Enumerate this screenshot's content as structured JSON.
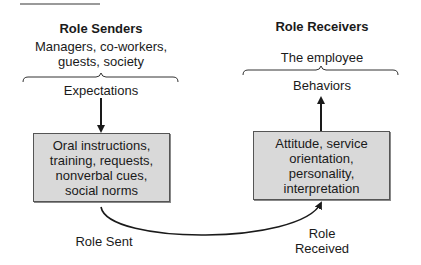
{
  "diagram": {
    "senders": {
      "title": "Role Senders",
      "who": "Managers, co-workers,\nguests, society",
      "who_line1": "Managers, co-workers,",
      "who_line2": "guests, society",
      "label": "Expectations",
      "box_text": "Oral instructions,\ntraining, requests,\nnonverbal cues,\nsocial norms"
    },
    "receivers": {
      "title": "Role Receivers",
      "who": "The employee",
      "label": "Behaviors",
      "box_text": "Attitude, service\norientation,\npersonality,\ninterpretation"
    },
    "flow": {
      "sent_label": "Role Sent",
      "received_line1": "Role",
      "received_line2": "Received"
    },
    "colors": {
      "box_fill": "#d9d9d9",
      "box_border": "#555555",
      "line": "#1a1a1a"
    }
  }
}
